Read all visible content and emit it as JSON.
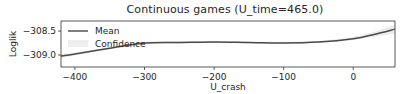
{
  "chart_data": {
    "type": "line",
    "title": "Continuous games (U_time=465.0)",
    "xlabel": "U_crash",
    "ylabel": "Loglik",
    "xlim": [
      -420,
      60
    ],
    "ylim": [
      -309.25,
      -308.29
    ],
    "xticks": [
      -400,
      -300,
      -200,
      -100,
      0
    ],
    "xtick_labels": [
      "−400",
      "−300",
      "−200",
      "−100",
      "0"
    ],
    "yticks": [
      -308.5,
      -309.0
    ],
    "ytick_labels": [
      "−308.5",
      "−309.0"
    ],
    "grid": false,
    "legend": {
      "position": "upper left",
      "entries": [
        "Mean",
        "Confidence"
      ]
    },
    "series": [
      {
        "name": "Mean",
        "x": [
          -420,
          -400,
          -350,
          -300,
          -250,
          -200,
          -150,
          -100,
          -50,
          0,
          30,
          60
        ],
        "values": [
          -309.02,
          -308.98,
          -308.86,
          -308.75,
          -308.74,
          -308.73,
          -308.74,
          -308.75,
          -308.73,
          -308.66,
          -308.57,
          -308.46
        ]
      },
      {
        "name": "Confidence",
        "x": [
          -420,
          -400,
          -350,
          -300,
          -250,
          -200,
          -150,
          -100,
          -50,
          0,
          30,
          60
        ],
        "lower": [
          -309.06,
          -309.01,
          -308.88,
          -308.77,
          -308.76,
          -308.75,
          -308.76,
          -308.77,
          -308.75,
          -308.69,
          -308.62,
          -308.55
        ],
        "upper": [
          -308.98,
          -308.95,
          -308.84,
          -308.73,
          -308.72,
          -308.71,
          -308.72,
          -308.73,
          -308.71,
          -308.63,
          -308.52,
          -308.37
        ]
      }
    ]
  }
}
